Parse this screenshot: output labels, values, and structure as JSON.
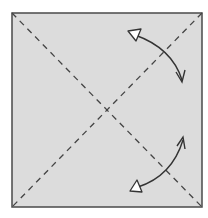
{
  "diagram": {
    "type": "origami-fold-instruction",
    "square": {
      "x": 12,
      "y": 13,
      "width": 190,
      "height": 194,
      "fill": "#dcdcdc",
      "stroke": "#4a4a4a"
    },
    "fold_lines": [
      {
        "name": "diagonal-top-left-to-bottom-right",
        "style": "dashed",
        "from": [
          12,
          13
        ],
        "to": [
          202,
          207
        ]
      },
      {
        "name": "diagonal-top-right-to-bottom-left",
        "style": "dashed",
        "from": [
          202,
          13
        ],
        "to": [
          12,
          207
        ]
      }
    ],
    "arrows": [
      {
        "name": "fold-unfold-arrow-top",
        "from": [
          133,
          33
        ],
        "to": [
          182,
          82
        ]
      },
      {
        "name": "fold-unfold-arrow-bottom",
        "from": [
          183,
          138
        ],
        "to": [
          134,
          189
        ]
      }
    ],
    "colors": {
      "line": "#444444",
      "arrow": "#333333",
      "arrowhead_hollow": "#ffffff"
    }
  }
}
